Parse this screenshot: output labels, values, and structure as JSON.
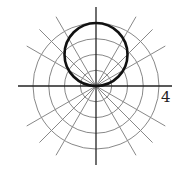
{
  "chart_data": {
    "type": "polar",
    "title": "",
    "equation": "r = 4 sin θ",
    "curve": "circle of diameter 4 centered at (0, 2) in Cartesian coordinates, tangent to the horizontal axis at the pole",
    "radial_rings": [
      1,
      2,
      3,
      4
    ],
    "radial_max": 4,
    "spoke_angles_deg": [
      0,
      30,
      45,
      60,
      90,
      120,
      135,
      150,
      180,
      210,
      225,
      240,
      270,
      300,
      315,
      330
    ],
    "tick_labels": [
      "4"
    ],
    "tick_label_position": "right end of horizontal axis, below the axis",
    "grid": true
  },
  "labels": {
    "radius_tick": "4"
  },
  "colors": {
    "grid": "#888888",
    "axes": "#222222",
    "curve": "#111111"
  }
}
